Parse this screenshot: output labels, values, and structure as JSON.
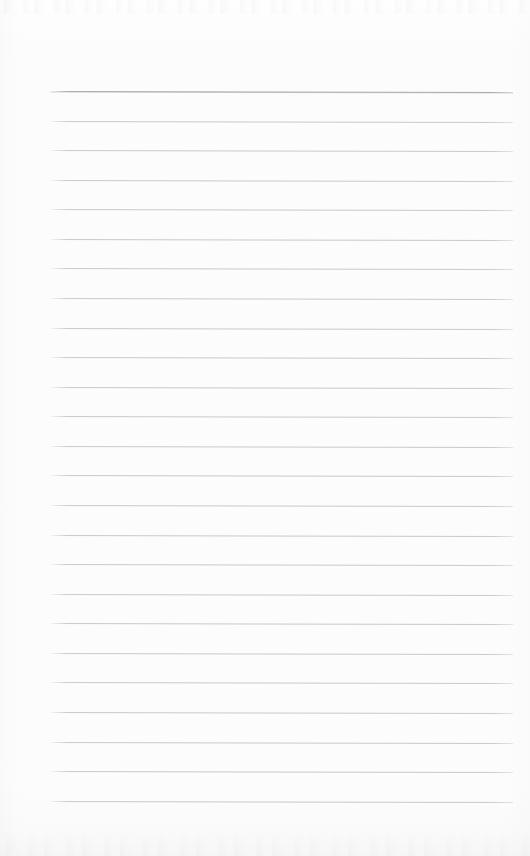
{
  "document": {
    "kind": "scanned-lined-notepad-page",
    "title": "Blank ruled notepad page",
    "content_text": "",
    "width_px": 530,
    "height_px": 856,
    "background_color": "#fdfdfd",
    "page_edge_color": "#f7f7f8"
  },
  "ruling": {
    "line_count": 25,
    "first_line_y": 91,
    "line_spacing_px": 29.6,
    "line_left_x": 50,
    "line_right_x": 513,
    "line_thickness_px": 1,
    "line_color": "#c9c9ce",
    "heavy_line_color": "#a9a9b0",
    "heavy_line_index": 0,
    "skew_degrees": 0.13,
    "lines": [
      {
        "index": 0,
        "y": 91,
        "weight": "heavy"
      },
      {
        "index": 1,
        "y": 121,
        "weight": "normal"
      },
      {
        "index": 2,
        "y": 150,
        "weight": "normal"
      },
      {
        "index": 3,
        "y": 180,
        "weight": "normal"
      },
      {
        "index": 4,
        "y": 209,
        "weight": "normal"
      },
      {
        "index": 5,
        "y": 239,
        "weight": "normal"
      },
      {
        "index": 6,
        "y": 268,
        "weight": "normal"
      },
      {
        "index": 7,
        "y": 298,
        "weight": "normal"
      },
      {
        "index": 8,
        "y": 328,
        "weight": "normal"
      },
      {
        "index": 9,
        "y": 357,
        "weight": "normal"
      },
      {
        "index": 10,
        "y": 387,
        "weight": "normal"
      },
      {
        "index": 11,
        "y": 416,
        "weight": "normal"
      },
      {
        "index": 12,
        "y": 446,
        "weight": "normal"
      },
      {
        "index": 13,
        "y": 475,
        "weight": "normal"
      },
      {
        "index": 14,
        "y": 505,
        "weight": "normal"
      },
      {
        "index": 15,
        "y": 535,
        "weight": "normal"
      },
      {
        "index": 16,
        "y": 564,
        "weight": "normal"
      },
      {
        "index": 17,
        "y": 594,
        "weight": "normal"
      },
      {
        "index": 18,
        "y": 623,
        "weight": "normal"
      },
      {
        "index": 19,
        "y": 653,
        "weight": "normal"
      },
      {
        "index": 20,
        "y": 682,
        "weight": "normal"
      },
      {
        "index": 21,
        "y": 712,
        "weight": "normal"
      },
      {
        "index": 22,
        "y": 742,
        "weight": "normal"
      },
      {
        "index": 23,
        "y": 771,
        "weight": "normal"
      },
      {
        "index": 24,
        "y": 801,
        "weight": "normal"
      }
    ]
  },
  "margins": {
    "top_blank_height_px": 91,
    "bottom_blank_height_px": 55,
    "left_blank_width_px": 50,
    "right_blank_width_px": 17
  },
  "artifacts": {
    "top_noise_band": "faint-scanner-streaks",
    "bottom_noise_band": "faint-scanner-streaks"
  }
}
